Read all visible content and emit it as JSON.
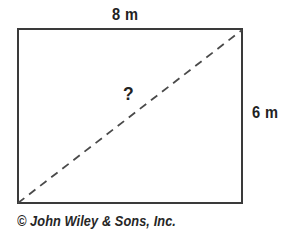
{
  "figure": {
    "type": "geometry-diagram",
    "shape": "rectangle",
    "background_color": "#ffffff",
    "stroke_color": "#3a3a3a",
    "dashed_stroke_color": "#4a4a4a",
    "text_color": "#222222",
    "labels": {
      "top": "8 m",
      "right": "6 m",
      "diagonal": "?"
    },
    "rectangle": {
      "x": 18,
      "y": 29,
      "width": 224,
      "height": 174,
      "stroke_width": 2.2
    },
    "diagonal": {
      "x1": 18,
      "y1": 203,
      "x2": 242,
      "y2": 30,
      "style": "dashed",
      "dash_length": 8,
      "dash_gap": 6,
      "stroke_width": 1.8
    }
  },
  "credit": {
    "text": "© John Wiley & Sons, Inc."
  },
  "chart_data": {
    "type": "table",
    "categories": [
      "width",
      "height",
      "diagonal"
    ],
    "values": [
      8,
      6,
      null
    ],
    "labels": [
      "8 m",
      "6 m",
      "?"
    ],
    "units": "m",
    "annotations": [
      "? marks the unknown diagonal length"
    ],
    "xlabel": "",
    "ylabel": "",
    "grid": false
  }
}
